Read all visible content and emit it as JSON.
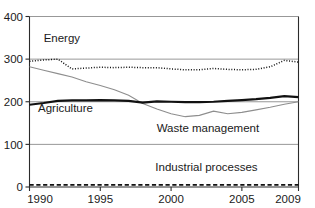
{
  "chart_data": {
    "type": "line",
    "title": "",
    "subtitle": "",
    "xlabel": "",
    "ylabel": "",
    "xlim": [
      1990,
      2009
    ],
    "ylim": [
      0,
      400
    ],
    "grid": true,
    "legend_position": "inline-annotations",
    "x": [
      1990,
      1991,
      1992,
      1993,
      1994,
      1995,
      1996,
      1997,
      1998,
      1999,
      2000,
      2001,
      2002,
      2003,
      2004,
      2005,
      2006,
      2007,
      2008,
      2009
    ],
    "xticks": [
      "1990",
      "1995",
      "2000",
      "2005",
      "2009"
    ],
    "xtick_values": [
      1990,
      1995,
      2000,
      2005,
      2009
    ],
    "yticks": [
      "0",
      "100",
      "200",
      "300",
      "400"
    ],
    "ytick_values": [
      0,
      100,
      200,
      300,
      400
    ],
    "series": [
      {
        "name": "Energy",
        "style": "dotted",
        "color": "#111111",
        "label_x": 1991.0,
        "label_y": 340,
        "values": [
          295,
          298,
          300,
          277,
          279,
          281,
          280,
          281,
          280,
          280,
          277,
          275,
          275,
          278,
          276,
          275,
          276,
          282,
          297,
          293
        ]
      },
      {
        "name": "Waste management",
        "style": "thin-solid",
        "color": "#8e8e8e",
        "label_x": 2002.6,
        "label_y": 128,
        "values": [
          282,
          274,
          266,
          258,
          247,
          238,
          228,
          215,
          196,
          183,
          172,
          165,
          168,
          178,
          172,
          175,
          181,
          187,
          194,
          200
        ]
      },
      {
        "name": "Agriculture",
        "style": "thick-solid",
        "color": "#111111",
        "label_x": 1990.6,
        "label_y": 176,
        "values": [
          193,
          197,
          202,
          203,
          203,
          204,
          203,
          202,
          198,
          201,
          200,
          199,
          199,
          200,
          202,
          204,
          206,
          209,
          213,
          211
        ]
      },
      {
        "name": "Industrial processes",
        "style": "dashed",
        "color": "#111111",
        "label_x": 2002.5,
        "label_y": 37,
        "values": [
          5,
          5,
          5,
          5,
          5,
          5,
          5,
          5,
          5,
          5,
          5,
          5,
          5,
          5,
          5,
          5,
          5,
          5,
          5,
          5
        ]
      }
    ]
  }
}
